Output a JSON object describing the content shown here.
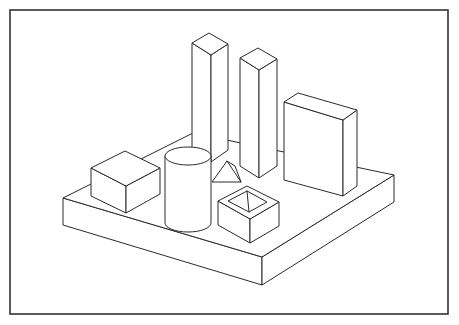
{
  "figure": {
    "kind": "technical-line-drawing",
    "background_color": "#ffffff",
    "stroke_color": "#2a2a2a",
    "frame_stroke_color": "#333333",
    "fill_color": "#ffffff",
    "stroke_width": 1,
    "frame_stroke_width": 1.6,
    "canvas": {
      "width": 459,
      "height": 325
    }
  },
  "frame": {
    "name": "outer-border",
    "x": 10,
    "y": 10,
    "width": 438,
    "height": 304
  },
  "base_platform": {
    "name": "base-slab",
    "description": "Large flat rectangular platform drawn in isometric projection",
    "top_face": "63,198 193,133 394,175 262,257",
    "front_left_face": "63,198 63,225 262,285 262,257",
    "front_right_face": "262,257 262,285 394,202 394,175",
    "thickness_px": 27
  },
  "solids": [
    {
      "id": "tower-tall-left",
      "name": "tall-rectangular-prism-left",
      "shape": "rectangular prism",
      "label": "Tall tower (left)",
      "top_face": "192,43 209,33 228,44 211,55",
      "left_face": "192,43 211,55 211,162 192,150",
      "right_face": "211,55 228,44 228,150 211,162",
      "height_px": 107
    },
    {
      "id": "tower-tall-right",
      "name": "tall-rectangular-prism-right",
      "shape": "rectangular prism",
      "label": "Tall tower (right)",
      "top_face": "240,58 258,48 277,59 259,70",
      "left_face": "240,58 259,70 259,178 240,166",
      "right_face": "259,70 277,59 277,166 259,178",
      "height_px": 108
    },
    {
      "id": "slab-wall",
      "name": "upright-slab-wall",
      "shape": "thin rectangular slab standing on edge",
      "label": "Upright wall slab",
      "top_face": "284,102 298,93 357,110 343,120",
      "left_face": "284,102 343,120 343,196 284,180",
      "right_face": "343,120 357,110 357,186 343,196",
      "height_px": 78
    },
    {
      "id": "cube-left",
      "name": "low-cube-left",
      "shape": "rectangular box",
      "label": "Low box (left)",
      "top_face": "91,168 125,151 160,168 126,186",
      "left_face": "91,168 126,186 126,213 91,196",
      "right_face": "126,186 160,168 160,194 126,213",
      "height_px": 27
    },
    {
      "id": "cylinder",
      "name": "cylinder",
      "shape": "circular cylinder",
      "label": "Cylinder",
      "center_x": 188,
      "top_center_y": 156,
      "bottom_center_y": 223,
      "radius_x": 23,
      "radius_y": 9,
      "height_px": 67
    },
    {
      "id": "open-box",
      "name": "open-topped-box",
      "shape": "hollow box with open top",
      "label": "Open-top box",
      "outer_top": "218,201 247,186 279,202 250,219",
      "inner_top": "228,201 247,191 267,202 249,212",
      "left_face": "218,201 250,219 250,243 218,225",
      "right_face": "250,219 279,202 279,226 250,243",
      "inner_back_wall": "228,201 247,191 267,202 249,212",
      "height_px": 24,
      "wall_thickness_px": 10
    },
    {
      "id": "wedge",
      "name": "small-wedge-prism",
      "shape": "wedge / triangular prism",
      "label": "Small wedge (partly occluded)",
      "outline": "212,182 227,161 241,182",
      "side": "227,161 241,182 241,177 233,166",
      "height_px": 21
    }
  ],
  "notes": {
    "projection": "isometric / axonometric",
    "line_style": "uniform thin black outline, no shading, white fills",
    "object_count": 7
  }
}
